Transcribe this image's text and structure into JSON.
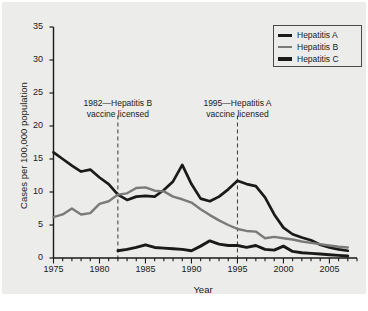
{
  "chart_data": {
    "type": "line",
    "title": "",
    "xlabel": "Year",
    "ylabel": "Cases per 100,000 population",
    "xlim": [
      1975,
      2008
    ],
    "ylim": [
      0,
      35
    ],
    "yticks": [
      0,
      5,
      10,
      15,
      20,
      25,
      30,
      35
    ],
    "xticks": [
      1975,
      1980,
      1985,
      1990,
      1995,
      2000,
      2005
    ],
    "xtick_minor_step": 1,
    "grid": false,
    "legend_position": "top-right",
    "x": [
      1975,
      1976,
      1977,
      1978,
      1979,
      1980,
      1981,
      1982,
      1983,
      1984,
      1985,
      1986,
      1987,
      1988,
      1989,
      1990,
      1991,
      1992,
      1993,
      1994,
      1995,
      1996,
      1997,
      1998,
      1999,
      2000,
      2001,
      2002,
      2003,
      2004,
      2005,
      2006,
      2007
    ],
    "series": [
      {
        "name": "Hepatitis A",
        "color": "#1a1a1a",
        "values": [
          16.0,
          15.0,
          14.0,
          13.1,
          13.4,
          12.2,
          11.2,
          9.6,
          8.8,
          9.3,
          9.4,
          9.3,
          10.3,
          11.6,
          14.1,
          11.2,
          9.0,
          8.6,
          9.3,
          10.4,
          11.7,
          11.2,
          10.9,
          9.2,
          6.6,
          4.6,
          3.6,
          3.1,
          2.7,
          2.0,
          1.6,
          1.3,
          1.1
        ]
      },
      {
        "name": "Hepatitis B",
        "color": "#7a7a7a",
        "values": [
          6.2,
          6.6,
          7.5,
          6.6,
          6.8,
          8.2,
          8.6,
          9.6,
          9.8,
          10.6,
          10.7,
          10.2,
          10.1,
          9.3,
          8.9,
          8.4,
          7.4,
          6.5,
          5.7,
          5.0,
          4.4,
          4.1,
          4.0,
          3.0,
          3.2,
          3.0,
          2.8,
          2.5,
          2.3,
          2.1,
          1.9,
          1.7,
          1.6
        ]
      },
      {
        "name": "Hepatitis C",
        "color": "#1a1a1a",
        "values": [
          null,
          null,
          null,
          null,
          null,
          null,
          null,
          1.1,
          1.3,
          1.6,
          2.0,
          1.6,
          1.5,
          1.4,
          1.3,
          1.1,
          1.8,
          2.6,
          2.1,
          1.9,
          1.9,
          1.6,
          1.9,
          1.3,
          1.2,
          1.8,
          1.0,
          0.8,
          0.7,
          0.6,
          0.5,
          0.4,
          0.3
        ]
      }
    ],
    "annotations": [
      {
        "x": 1982,
        "line1": "1982—Hepatitis B",
        "line2": "vaccine licensed",
        "style": "dashed-vline"
      },
      {
        "x": 1995,
        "line1": "1995—Hepatitis A",
        "line2": "vaccine licensed",
        "style": "dashed-vline"
      }
    ]
  },
  "legend": {
    "items": [
      {
        "label": "Hepatitis A",
        "color": "#1a1a1a",
        "width": 3
      },
      {
        "label": "Hepatitis B",
        "color": "#7a7a7a",
        "width": 2.5
      },
      {
        "label": "Hepatitis C",
        "color": "#1a1a1a",
        "width": 3.5
      }
    ]
  }
}
